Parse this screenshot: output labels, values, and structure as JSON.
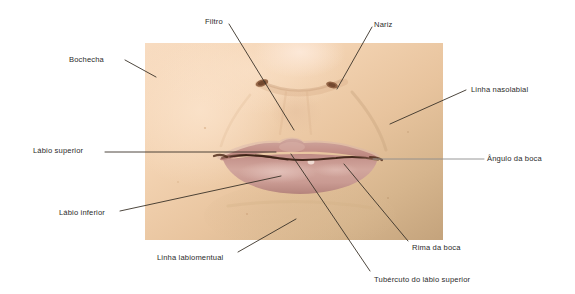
{
  "figure": {
    "language": "pt-BR",
    "background_color": "#ffffff",
    "photo": {
      "name": "photo-mouth-region",
      "x": 145,
      "y": 43,
      "width": 298,
      "height": 197,
      "skin_light_color": "#f6d8bb",
      "skin_mid_color": "#eec9a6",
      "skin_tan_color": "#cbac85",
      "lip_color": "#c99a93",
      "lip_line_color": "#6a4434",
      "nostril_color": "#8a5a3c"
    },
    "leader_line_color": "#3a3228",
    "leader_line_gray_color": "#8d8d8d"
  },
  "labels": [
    {
      "id": "filtro",
      "name": "label-filtro",
      "text": "Filtro",
      "text_x": 205,
      "text_y": 18,
      "line": {
        "x1": 229,
        "y1": 24,
        "x2": 294,
        "y2": 130
      },
      "line_color": "#3a3228"
    },
    {
      "id": "nariz",
      "name": "label-nariz",
      "text": "Nariz",
      "text_x": 374,
      "text_y": 21,
      "line": {
        "x1": 372,
        "y1": 27,
        "x2": 337,
        "y2": 89
      },
      "line_color": "#3a3228"
    },
    {
      "id": "bochecha",
      "name": "label-bochecha",
      "text": "Bochecha",
      "text_x": 69,
      "text_y": 56,
      "line": {
        "x1": 125,
        "y1": 60,
        "x2": 156,
        "y2": 77
      },
      "line_color": "#3a3228"
    },
    {
      "id": "linha-nasolabial",
      "name": "label-linha-nasolabial",
      "text": "Linha nasolabial",
      "text_x": 471,
      "text_y": 86,
      "line": {
        "x1": 466,
        "y1": 90,
        "x2": 390,
        "y2": 124
      },
      "line_color": "#3a3228"
    },
    {
      "id": "labio-superior",
      "name": "label-labio-superior",
      "text": "Lábio superior",
      "text_x": 33,
      "text_y": 147,
      "line": {
        "x1": 105,
        "y1": 152,
        "x2": 276,
        "y2": 152
      },
      "line_color": "#3a3228"
    },
    {
      "id": "angulo-da-boca",
      "name": "label-angulo-da-boca",
      "text": "Ângulo da boca",
      "text_x": 487,
      "text_y": 155,
      "line": {
        "x1": 484,
        "y1": 159,
        "x2": 373,
        "y2": 159
      },
      "line_color": "#8d8d8d"
    },
    {
      "id": "labio-inferior",
      "name": "label-labio-inferior",
      "text": "Lábio inferior",
      "text_x": 59,
      "text_y": 209,
      "line": {
        "x1": 120,
        "y1": 211,
        "x2": 281,
        "y2": 176
      },
      "line_color": "#3a3228"
    },
    {
      "id": "linha-labiomentual",
      "name": "label-linha-labiomentual",
      "text": "Linha labiomentual",
      "text_x": 157,
      "text_y": 254,
      "line": {
        "x1": 238,
        "y1": 252,
        "x2": 296,
        "y2": 219
      },
      "line_color": "#3a3228"
    },
    {
      "id": "rima-da-boca",
      "name": "label-rima-da-boca",
      "text": "Rima da boca",
      "text_x": 412,
      "text_y": 244,
      "line": {
        "x1": 408,
        "y1": 241,
        "x2": 344,
        "y2": 164
      },
      "line_color": "#3a3228"
    },
    {
      "id": "tuberculo-do-labio-superior",
      "name": "label-tuberculo-do-labio-superior",
      "text": "Tubércuto do lábio superior",
      "text_x": 374,
      "text_y": 276,
      "line": {
        "x1": 370,
        "y1": 271,
        "x2": 291,
        "y2": 154
      },
      "line_color": "#3a3228"
    }
  ]
}
